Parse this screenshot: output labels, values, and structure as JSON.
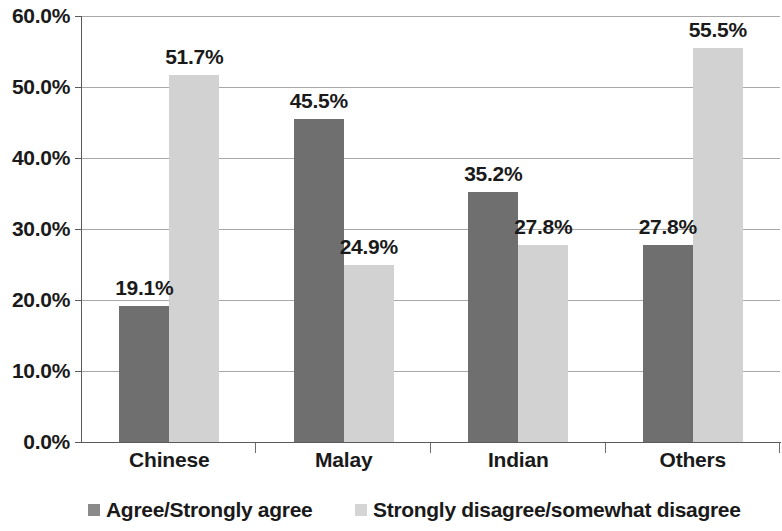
{
  "chart_data": {
    "type": "bar",
    "title": "",
    "subtitle": "",
    "xlabel": "",
    "ylabel": "",
    "categories": [
      "Chinese",
      "Malay",
      "Indian",
      "Others"
    ],
    "series": [
      {
        "name": "Agree/Strongly agree",
        "color": "#6f6f6f",
        "values": [
          19.1,
          45.5,
          35.2,
          27.8
        ],
        "labels": [
          "19.1%",
          "45.5%",
          "35.2%",
          "27.8%"
        ]
      },
      {
        "name": "Strongly disagree/somewhat disagree",
        "color": "#d2d2d2",
        "values": [
          51.7,
          24.9,
          27.8,
          55.5
        ],
        "labels": [
          "51.7%",
          "24.9%",
          "27.8%",
          "55.5%"
        ]
      }
    ],
    "ylim": [
      0,
      60
    ],
    "ytick_step": 10,
    "ytick_labels": [
      "60.0%",
      "50.0%",
      "40.0%",
      "30.0%",
      "20.0%",
      "10.0%",
      "0.0%"
    ],
    "ytick_values": [
      60,
      50,
      40,
      30,
      20,
      10,
      0
    ],
    "grid": true,
    "legend_position": "bottom"
  },
  "legend": {
    "items": [
      {
        "label": "Agree/Strongly agree",
        "swatch": "legend-swatch-dark"
      },
      {
        "label": "Strongly disagree/somewhat disagree",
        "swatch": "legend-swatch-light"
      }
    ]
  }
}
